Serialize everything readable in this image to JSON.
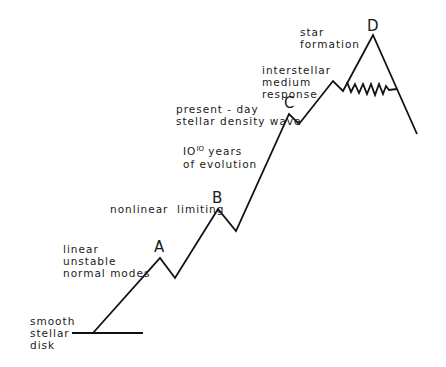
{
  "diagram": {
    "type": "evolution-path",
    "stages": [
      {
        "id": "start",
        "label": "smooth\nstellar\ndisk"
      },
      {
        "id": "A",
        "marker": "A",
        "label": "linear\nunstable\nnormal modes"
      },
      {
        "id": "B",
        "marker": "B",
        "label": "nonlinear  limiting"
      },
      {
        "id": "C",
        "marker": "C",
        "label": "present - day\nstellar density wave"
      },
      {
        "id": "evolution",
        "label_base": "IO",
        "label_exp": "IO",
        "label_rest": " years",
        "label_line2": "of evolution"
      },
      {
        "id": "ism",
        "label": "interstellar\nmedium\nresponse"
      },
      {
        "id": "D",
        "marker": "D",
        "label": "star\nformation"
      }
    ],
    "line_color": "#111111",
    "background": "#ffffff"
  }
}
